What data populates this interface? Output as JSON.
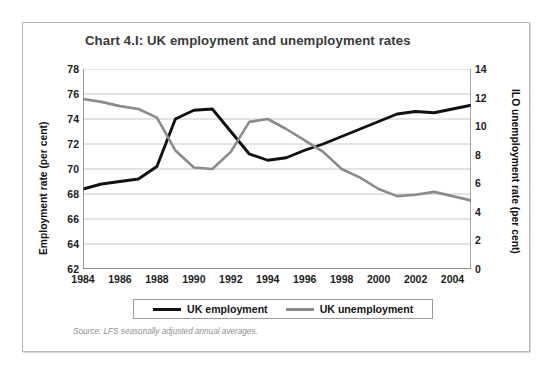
{
  "panel": {
    "title": "Chart 4.I: UK employment and unemployment rates",
    "source_note": "Source: LFS seasonally adjusted annual averages."
  },
  "legend": {
    "items": [
      {
        "label": "UK employment",
        "color": "#111111"
      },
      {
        "label": "UK unemployment",
        "color": "#8b8b8b"
      }
    ]
  },
  "chart_data": {
    "type": "line",
    "title": "Chart 4.I: UK employment and unemployment rates",
    "xlabel": "",
    "ylabel": "Employment rate (per cent)",
    "y2label": "ILO unemployment rate (per cent)",
    "grid": true,
    "legend_position": "bottom",
    "x": [
      1984,
      1985,
      1986,
      1987,
      1988,
      1989,
      1990,
      1991,
      1992,
      1993,
      1994,
      1995,
      1996,
      1997,
      1998,
      1999,
      2000,
      2001,
      2002,
      2003,
      2004,
      2005
    ],
    "xlim": [
      1984,
      2005
    ],
    "xticks": [
      1984,
      1986,
      1988,
      1990,
      1992,
      1994,
      1996,
      1998,
      2000,
      2002,
      2004
    ],
    "xticklabels": [
      "1984",
      "1986",
      "1988",
      "1990",
      "1992",
      "1994",
      "1996",
      "1998",
      "2000",
      "2002",
      "2004"
    ],
    "ylim": [
      62,
      78
    ],
    "yticks": [
      62,
      64,
      66,
      68,
      70,
      72,
      74,
      76,
      78
    ],
    "yticklabels": [
      "62",
      "64",
      "66",
      "68",
      "70",
      "72",
      "74",
      "76",
      "78"
    ],
    "y2lim": [
      0,
      14
    ],
    "y2ticks": [
      0,
      2,
      4,
      6,
      8,
      10,
      12,
      14
    ],
    "y2ticklabels": [
      "0",
      "2",
      "4",
      "6",
      "8",
      "10",
      "12",
      "14"
    ],
    "series": [
      {
        "name": "UK employment",
        "axis": "left",
        "color": "#111111",
        "values": [
          68.4,
          68.8,
          69.0,
          69.2,
          70.2,
          74.0,
          74.7,
          74.8,
          73.0,
          71.2,
          70.7,
          70.9,
          71.5,
          72.0,
          72.6,
          73.2,
          73.8,
          74.4,
          74.6,
          74.5,
          74.8,
          75.1
        ]
      },
      {
        "name": "UK unemployment",
        "axis": "right",
        "color": "#8b8b8b",
        "values": [
          11.9,
          11.7,
          11.4,
          11.2,
          10.6,
          8.3,
          7.1,
          7.0,
          8.2,
          10.3,
          10.5,
          9.8,
          9.0,
          8.2,
          7.0,
          6.4,
          5.6,
          5.1,
          5.2,
          5.4,
          5.1,
          4.8
        ]
      }
    ]
  }
}
